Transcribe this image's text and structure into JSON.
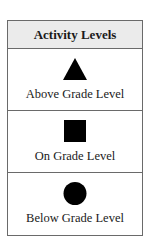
{
  "legend": {
    "title": "Activity Levels",
    "items": [
      {
        "icon": "triangle-icon",
        "label": "Above Grade Level"
      },
      {
        "icon": "square-icon",
        "label": "On Grade Level"
      },
      {
        "icon": "circle-icon",
        "label": "Below Grade Level"
      }
    ]
  }
}
